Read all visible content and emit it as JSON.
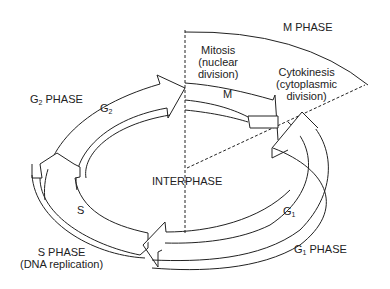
{
  "diagram": {
    "labels": {
      "m_phase": "M PHASE",
      "mitosis": [
        "Mitosis",
        "(nuclear",
        "division)"
      ],
      "cytokinesis": [
        "Cytokinesis",
        "(cytoplasmic",
        "division)"
      ],
      "m": "M",
      "g2_phase_prefix": "G",
      "g2_phase_sub": "2",
      "g2_phase_suffix": " PHASE",
      "g2_prefix": "G",
      "g2_sub": "2",
      "interphase": "INTERPHASE",
      "s": "S",
      "s_phase": [
        "S PHASE",
        "(DNA replication)"
      ],
      "g1_prefix": "G",
      "g1_sub": "1",
      "g1_phase_prefix": "G",
      "g1_phase_sub": "1",
      "g1_phase_suffix": " PHASE"
    },
    "colors": {
      "stroke": "#222222",
      "fill": "#ffffff",
      "background": "#ffffff"
    }
  }
}
